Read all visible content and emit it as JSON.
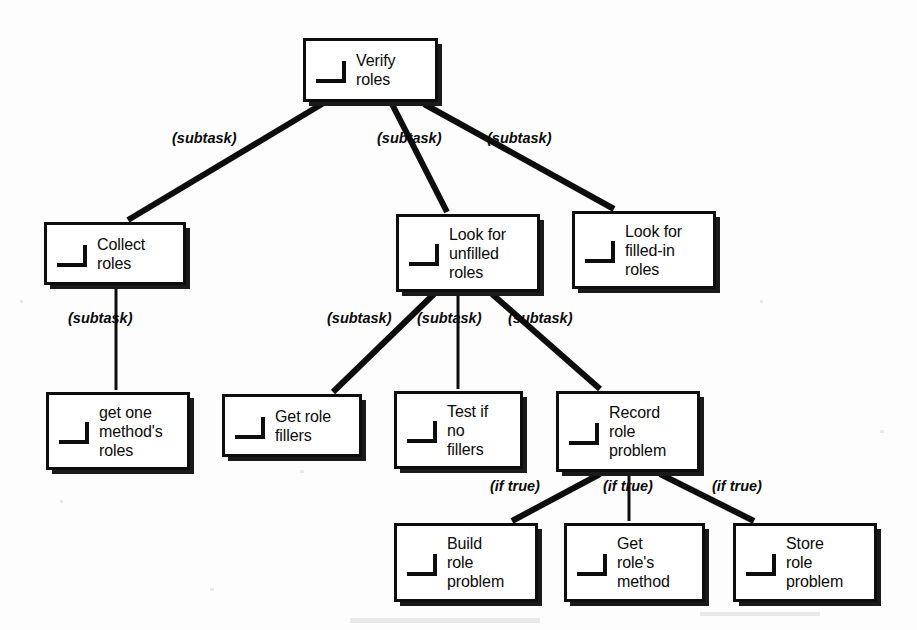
{
  "diagram": {
    "icon_name": "task-corner-icon",
    "nodes": [
      {
        "id": "verify-roles",
        "label": "Verify\nroles",
        "x": 303,
        "y": 38,
        "w": 135,
        "h": 64
      },
      {
        "id": "collect-roles",
        "label": "Collect\nroles",
        "x": 44,
        "y": 222,
        "w": 142,
        "h": 63
      },
      {
        "id": "look-unfilled",
        "label": "Look for\nunfilled\nroles",
        "x": 396,
        "y": 214,
        "w": 144,
        "h": 78
      },
      {
        "id": "look-filled-in",
        "label": "Look for\nfilled-in\nroles",
        "x": 572,
        "y": 211,
        "w": 144,
        "h": 78
      },
      {
        "id": "get-one-methods",
        "label": "get one\nmethod's\nroles",
        "x": 46,
        "y": 392,
        "w": 144,
        "h": 78
      },
      {
        "id": "get-role-fillers",
        "label": "Get role\nfillers",
        "x": 222,
        "y": 394,
        "w": 140,
        "h": 63
      },
      {
        "id": "test-if-no-fillers",
        "label": "Test if\nno\nfillers",
        "x": 394,
        "y": 391,
        "w": 129,
        "h": 78
      },
      {
        "id": "record-role-problem",
        "label": "Record\nrole\nproblem",
        "x": 556,
        "y": 391,
        "w": 144,
        "h": 81
      },
      {
        "id": "build-role-problem",
        "label": "Build\nrole\nproblem",
        "x": 394,
        "y": 523,
        "w": 144,
        "h": 79
      },
      {
        "id": "get-roles-method",
        "label": "Get\nrole's\nmethod",
        "x": 564,
        "y": 523,
        "w": 141,
        "h": 79
      },
      {
        "id": "store-role-problem",
        "label": "Store\nrole\nproblem",
        "x": 733,
        "y": 523,
        "w": 144,
        "h": 79
      }
    ],
    "edges": [
      {
        "id": "e-verify-collect",
        "from": "verify-roles",
        "to": "collect-roles",
        "x1": 322,
        "y1": 104,
        "x2": 128,
        "y2": 220,
        "label": "(subtask)",
        "lx": 172,
        "ly": 130,
        "thick": true
      },
      {
        "id": "e-verify-unfilled",
        "from": "verify-roles",
        "to": "look-unfilled",
        "x1": 392,
        "y1": 104,
        "x2": 447,
        "y2": 212,
        "label": "(subtask)",
        "lx": 377,
        "ly": 130,
        "thick": true
      },
      {
        "id": "e-verify-filledin",
        "from": "verify-roles",
        "to": "look-filled-in",
        "x1": 424,
        "y1": 104,
        "x2": 614,
        "y2": 209,
        "label": "(subtask)",
        "lx": 487,
        "ly": 130,
        "thick": true
      },
      {
        "id": "e-collect-getone",
        "from": "collect-roles",
        "to": "get-one-methods",
        "x1": 116,
        "y1": 287,
        "x2": 116,
        "y2": 390,
        "label": "(subtask)",
        "lx": 68,
        "ly": 310,
        "thick": false
      },
      {
        "id": "e-unfilled-getfillers",
        "from": "look-unfilled",
        "to": "get-role-fillers",
        "x1": 434,
        "y1": 294,
        "x2": 333,
        "y2": 392,
        "label": "(subtask)",
        "lx": 327,
        "ly": 310,
        "thick": true
      },
      {
        "id": "e-unfilled-testif",
        "from": "look-unfilled",
        "to": "test-if-no-fillers",
        "x1": 458,
        "y1": 294,
        "x2": 458,
        "y2": 389,
        "label": "(subtask)",
        "lx": 417,
        "ly": 310,
        "thick": false
      },
      {
        "id": "e-unfilled-record",
        "from": "look-unfilled",
        "to": "record-role-problem",
        "x1": 492,
        "y1": 294,
        "x2": 600,
        "y2": 389,
        "label": "(subtask)",
        "lx": 508,
        "ly": 310,
        "thick": true
      },
      {
        "id": "e-record-build",
        "from": "record-role-problem",
        "to": "build-role-problem",
        "x1": 600,
        "y1": 474,
        "x2": 512,
        "y2": 521,
        "label": "(if true)",
        "lx": 490,
        "ly": 478,
        "thick": true
      },
      {
        "id": "e-record-getmethod",
        "from": "record-role-problem",
        "to": "get-roles-method",
        "x1": 629,
        "y1": 474,
        "x2": 629,
        "y2": 521,
        "label": "(if true)",
        "lx": 603,
        "ly": 478,
        "thick": false
      },
      {
        "id": "e-record-store",
        "from": "record-role-problem",
        "to": "store-role-problem",
        "x1": 660,
        "y1": 474,
        "x2": 754,
        "y2": 521,
        "label": "(if true)",
        "lx": 712,
        "ly": 478,
        "thick": true
      }
    ],
    "colors": {
      "node_border": "#0d0d0d",
      "node_fill": "#ffffff",
      "shadow": "#1a1a1a",
      "edge": "#0d0d0d",
      "text": "#0a0a0a",
      "background": "#fdfdfd"
    }
  }
}
